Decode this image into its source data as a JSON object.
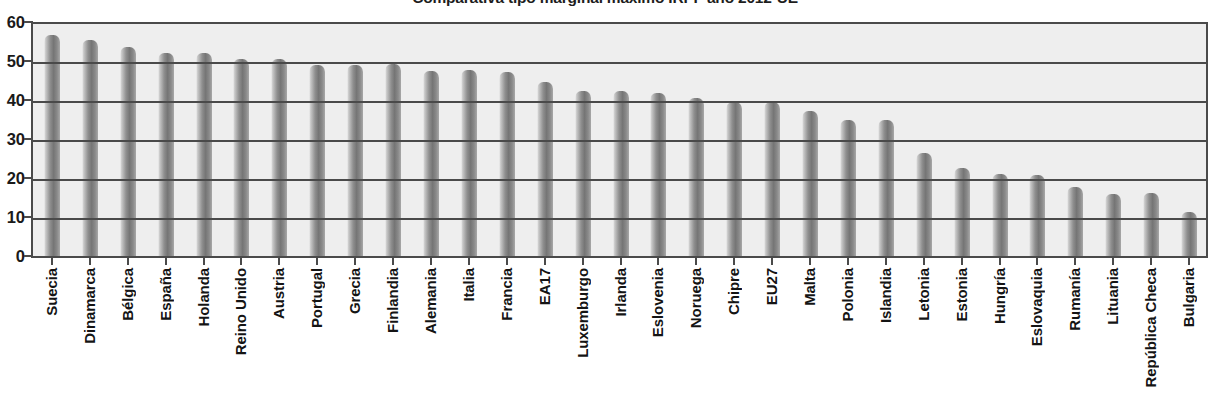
{
  "chart_data": {
    "type": "bar",
    "title": "Comparativa tipo marginal máximo IRPF año 2012-UE",
    "xlabel": "",
    "ylabel": "",
    "ylim": [
      0,
      60
    ],
    "ytick_step": 10,
    "yticks": [
      60,
      50,
      40,
      30,
      20,
      10,
      0
    ],
    "grid": true,
    "legend": false,
    "legend_position": "none",
    "categories": [
      "Suecia",
      "Dinamarca",
      "Bélgica",
      "España",
      "Holanda",
      "Reino Unido",
      "Austria",
      "Portugal",
      "Grecia",
      "Finlandia",
      "Alemania",
      "Italia",
      "Francia",
      "EA17",
      "Luxemburgo",
      "Irlanda",
      "Eslovenia",
      "Noruega",
      "Chipre",
      "EU27",
      "Malta",
      "Polonia",
      "Islandia",
      "Letonia",
      "Estonia",
      "Hungría",
      "Eslovaquia",
      "Rumanía",
      "Lituania",
      "República Checa",
      "Bulgaria"
    ],
    "values": [
      56.6,
      55.4,
      53.7,
      52.0,
      52.0,
      50.6,
      50.6,
      49.0,
      49.0,
      49.2,
      47.5,
      47.8,
      47.2,
      44.5,
      42.4,
      42.4,
      41.9,
      40.6,
      39.5,
      39.4,
      37.2,
      34.8,
      34.8,
      26.4,
      22.6,
      21.1,
      20.8,
      17.8,
      15.9,
      16.2,
      11.3
    ]
  }
}
